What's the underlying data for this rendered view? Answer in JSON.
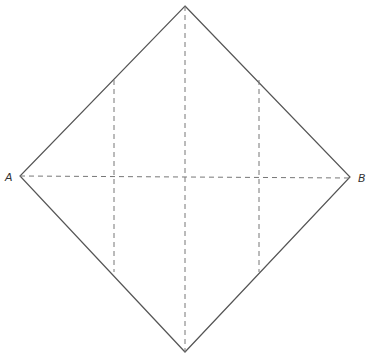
{
  "diagram": {
    "type": "folding-square",
    "labels": {
      "left": "A",
      "right": "B"
    },
    "colors": {
      "edge": "#555555",
      "fold": "#777777"
    },
    "vertices": {
      "top": [
        185,
        6
      ],
      "right": [
        350,
        177
      ],
      "bottom": [
        185,
        352
      ],
      "left": [
        20,
        176
      ]
    },
    "fold_lines": [
      {
        "name": "diagonal-horizontal",
        "from": [
          20,
          176
        ],
        "to": [
          350,
          178
        ]
      },
      {
        "name": "diagonal-vertical",
        "from": [
          185,
          6
        ],
        "to": [
          185,
          352
        ]
      },
      {
        "name": "left-vertical",
        "from": [
          114,
          80
        ],
        "to": [
          114,
          272
        ]
      },
      {
        "name": "right-vertical",
        "from": [
          259,
          80
        ],
        "to": [
          259,
          272
        ]
      }
    ]
  }
}
